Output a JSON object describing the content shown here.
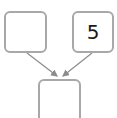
{
  "diagram": {
    "nodes": [
      {
        "id": "left",
        "value": ""
      },
      {
        "id": "right",
        "value": "5"
      },
      {
        "id": "bottom",
        "value": ""
      }
    ],
    "edges": [
      {
        "from": "left",
        "to": "bottom"
      },
      {
        "from": "right",
        "to": "bottom"
      }
    ],
    "colors": {
      "border": "#a8a8a8",
      "arrow": "#8c8c8c",
      "text": "#1a1a1a"
    }
  }
}
